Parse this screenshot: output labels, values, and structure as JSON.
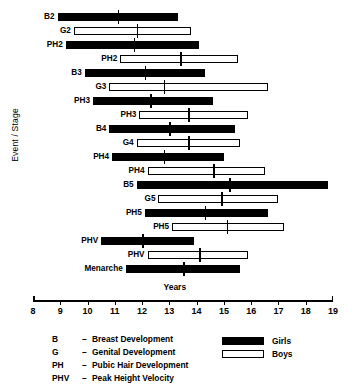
{
  "chart_data": {
    "type": "bar",
    "title": "",
    "xlabel": "Years",
    "ylabel": "Event / Stage",
    "xlim": [
      8,
      19
    ],
    "xticks": [
      8,
      9,
      10,
      11,
      12,
      13,
      14,
      15,
      16,
      17,
      18,
      19
    ],
    "grid": false,
    "orientation": "horizontal",
    "note": "Horizontal range bars showing age span (start-end) for each pubertal event, with a median tick mark.",
    "series": [
      {
        "name": "Girls",
        "color": "#000000",
        "fill": "solid"
      },
      {
        "name": "Boys",
        "color": "#ffffff",
        "fill": "outline"
      }
    ],
    "rows": [
      {
        "label": "B2",
        "series": "Girls",
        "start": 8.9,
        "end": 13.3,
        "median": 11.1
      },
      {
        "label": "G2",
        "series": "Boys",
        "start": 9.5,
        "end": 13.8,
        "median": 11.8
      },
      {
        "label": "PH2",
        "series": "Girls",
        "start": 9.2,
        "end": 14.1,
        "median": 11.7
      },
      {
        "label": "PH2",
        "series": "Boys",
        "start": 11.2,
        "end": 15.5,
        "median": 13.4
      },
      {
        "label": "B3",
        "series": "Girls",
        "start": 9.9,
        "end": 14.3,
        "median": 12.1
      },
      {
        "label": "G3",
        "series": "Boys",
        "start": 10.8,
        "end": 16.6,
        "median": 12.8
      },
      {
        "label": "PH3",
        "series": "Girls",
        "start": 10.2,
        "end": 14.6,
        "median": 12.3
      },
      {
        "label": "PH3",
        "series": "Boys",
        "start": 11.9,
        "end": 15.9,
        "median": 13.7
      },
      {
        "label": "B4",
        "series": "Girls",
        "start": 10.8,
        "end": 15.4,
        "median": 13.0
      },
      {
        "label": "G4",
        "series": "Boys",
        "start": 11.8,
        "end": 15.6,
        "median": 13.7
      },
      {
        "label": "PH4",
        "series": "Girls",
        "start": 10.9,
        "end": 15.0,
        "median": 12.8
      },
      {
        "label": "PH4",
        "series": "Boys",
        "start": 12.2,
        "end": 16.5,
        "median": 14.6
      },
      {
        "label": "B5",
        "series": "Girls",
        "start": 11.8,
        "end": 18.8,
        "median": 15.2
      },
      {
        "label": "G5",
        "series": "Boys",
        "start": 12.6,
        "end": 17.0,
        "median": 14.9
      },
      {
        "label": "PH5",
        "series": "Girls",
        "start": 12.1,
        "end": 16.6,
        "median": 14.3
      },
      {
        "label": "PH5",
        "series": "Boys",
        "start": 13.1,
        "end": 17.2,
        "median": 15.1
      },
      {
        "label": "PHV",
        "series": "Girls",
        "start": 10.5,
        "end": 13.9,
        "median": 12.0
      },
      {
        "label": "PHV",
        "series": "Boys",
        "start": 12.2,
        "end": 15.9,
        "median": 14.1
      },
      {
        "label": "Menarche",
        "series": "Girls",
        "start": 11.4,
        "end": 15.6,
        "median": 13.5
      }
    ]
  },
  "legend": {
    "definitions": [
      {
        "abbr": "B",
        "dash": "–",
        "text": "Breast Development"
      },
      {
        "abbr": "G",
        "dash": "–",
        "text": "Genital Development"
      },
      {
        "abbr": "PH",
        "dash": "–",
        "text": "Pubic Hair Development"
      },
      {
        "abbr": "PHV",
        "dash": "–",
        "text": "Peak Height Velocity"
      }
    ],
    "keys": [
      {
        "label": "Girls",
        "style": "girls"
      },
      {
        "label": "Boys",
        "style": "boys"
      }
    ]
  }
}
